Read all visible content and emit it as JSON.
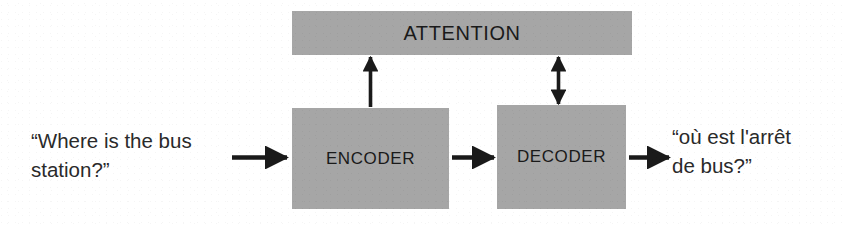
{
  "diagram": {
    "colors": {
      "block_fill": "#a6a6a6",
      "text": "#1a1a1a",
      "arrow": "#1a1a1a",
      "background": "#ffffff"
    },
    "blocks": [
      {
        "id": "attention",
        "label": "ATTENTION"
      },
      {
        "id": "encoder",
        "label": "ENCODER"
      },
      {
        "id": "decoder",
        "label": "DECODER"
      }
    ],
    "texts": {
      "input": "“Where is the bus\nstation?”",
      "output": "“où est l'arrêt\nde bus?”"
    },
    "arrows": [
      {
        "id": "input-to-encoder",
        "from": "input-text",
        "to": "encoder",
        "direction": "right",
        "heads": 1
      },
      {
        "id": "encoder-to-decoder",
        "from": "encoder",
        "to": "decoder",
        "direction": "right",
        "heads": 1
      },
      {
        "id": "decoder-to-output",
        "from": "decoder",
        "to": "output-text",
        "direction": "right",
        "heads": 1
      },
      {
        "id": "encoder-to-attention",
        "from": "encoder",
        "to": "attention",
        "direction": "up",
        "heads": 1
      },
      {
        "id": "decoder-attention-bidirectional",
        "from": "decoder",
        "to": "attention",
        "direction": "both",
        "heads": 2
      }
    ]
  }
}
